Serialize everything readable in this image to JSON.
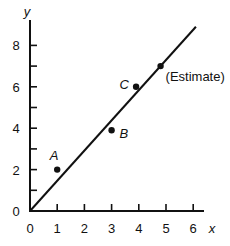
{
  "chart_data": {
    "type": "scatter",
    "title": "",
    "xlabel": "x",
    "ylabel": "y",
    "xlim": [
      0,
      6.5
    ],
    "ylim": [
      0,
      9
    ],
    "x_ticks": [
      "0",
      "1",
      "2",
      "3",
      "4",
      "5",
      "6"
    ],
    "y_ticks": [
      "0",
      "2",
      "4",
      "6",
      "8"
    ],
    "grid": false,
    "points": [
      {
        "label": "A",
        "x": 1,
        "y": 2
      },
      {
        "label": "B",
        "x": 3,
        "y": 3.9
      },
      {
        "label": "C",
        "x": 3.9,
        "y": 6
      },
      {
        "label": "(Estimate)",
        "x": 4.8,
        "y": 7
      }
    ],
    "line": {
      "x0": 0,
      "y0": 0,
      "x1": 6.1,
      "y1": 8.9,
      "slope": 1.45
    }
  }
}
